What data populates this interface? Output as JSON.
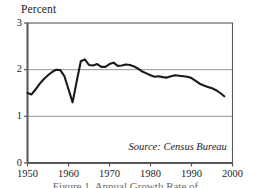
{
  "figure": {
    "y_axis_title": "Percent",
    "source_note": "Source: Census Bureau",
    "caption_partial": "Figure 1. Annual Growth Rate of ..."
  },
  "colors": {
    "line": "#1a1a1a",
    "frame": "#5a5a5a",
    "gridline": "#8a8a8a",
    "background": "#ffffff",
    "text": "#1d1d1d"
  },
  "chart_data": {
    "type": "line",
    "title": "",
    "subtitle": "",
    "xlabel": "",
    "ylabel": "Percent",
    "xlim": [
      1950,
      2000
    ],
    "ylim": [
      0,
      3
    ],
    "grid": true,
    "gridlines_y": [
      1,
      2
    ],
    "legend_position": "none",
    "annotations": [
      "Source: Census Bureau"
    ],
    "ytick_labels": [
      "0",
      "1",
      "2",
      "3"
    ],
    "yticks": [
      0,
      1,
      2,
      3
    ],
    "xtick_labels": [
      "1950",
      "1960",
      "1970",
      "1980",
      "1990",
      "2000"
    ],
    "xticks": [
      1950,
      1960,
      1970,
      1980,
      1990,
      2000
    ],
    "series": [
      {
        "name": "Percent",
        "x": [
          1950,
          1951,
          1952,
          1953,
          1954,
          1955,
          1956,
          1957,
          1958,
          1959,
          1960,
          1961,
          1962,
          1963,
          1964,
          1965,
          1966,
          1967,
          1968,
          1969,
          1970,
          1971,
          1972,
          1973,
          1974,
          1975,
          1976,
          1977,
          1978,
          1979,
          1980,
          1981,
          1982,
          1983,
          1984,
          1985,
          1986,
          1987,
          1988,
          1989,
          1990,
          1991,
          1992,
          1993,
          1994,
          1995,
          1996,
          1997,
          1998
        ],
        "values": [
          1.5,
          1.47,
          1.58,
          1.7,
          1.8,
          1.88,
          1.95,
          2.0,
          1.99,
          1.86,
          1.58,
          1.3,
          1.75,
          2.18,
          2.22,
          2.1,
          2.09,
          2.12,
          2.06,
          2.06,
          2.12,
          2.15,
          2.08,
          2.09,
          2.11,
          2.1,
          2.07,
          2.02,
          1.96,
          1.92,
          1.88,
          1.85,
          1.86,
          1.84,
          1.83,
          1.86,
          1.88,
          1.87,
          1.86,
          1.85,
          1.82,
          1.76,
          1.7,
          1.66,
          1.63,
          1.6,
          1.56,
          1.5,
          1.43
        ]
      }
    ]
  }
}
